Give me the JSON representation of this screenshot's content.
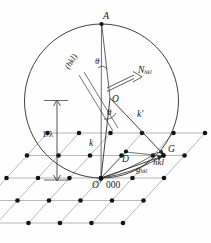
{
  "figure": {
    "name": "ewald-sphere-construction",
    "stroke_color": "#2b2b2b",
    "lattice_line_color": "#8c8c8c",
    "node_color": "#1a1a1a",
    "background": "#fefefe"
  },
  "labels": {
    "apex": "A",
    "theta_top": "θ",
    "theta_lower": "θ",
    "plane_trace": "(hkl)",
    "normal_vector": "N",
    "normal_sub": "hkl",
    "sphere_center": "O",
    "incident_wavevector": "k",
    "diffracted_wavevector": "k′",
    "radius_dim": "1/λ",
    "origin_point": "O′",
    "origin_index": "000",
    "reflection_point": "G",
    "reflection_index": "hkl",
    "scattering_vector": "g",
    "scattering_sub": "hkl",
    "spacing_point": "D"
  },
  "geometry": {
    "circle": {
      "cx": 101.5,
      "cy": 101.0,
      "r": 77.0
    },
    "apex_point": {
      "x": 101.5,
      "y": 24.0
    },
    "center_point": {
      "x": 110.0,
      "y": 98.0
    },
    "origin_point": {
      "x": 101.0,
      "y": 178.0
    },
    "reflection_point": {
      "x": 164.0,
      "y": 155.0
    },
    "dimension_line_x": 57.0,
    "dimension_top_y": 100.0,
    "dimension_bottom_y": 180.0
  },
  "lattice": {
    "rows": 5,
    "cols": 6,
    "origin": {
      "x": 101.0,
      "y": 178.0
    },
    "vec_a": {
      "x": 31.5,
      "y": 0.0
    },
    "vec_b": {
      "x": -20.5,
      "y": 22.5
    },
    "row_offset_start": -2,
    "col_offset_start": -3
  }
}
